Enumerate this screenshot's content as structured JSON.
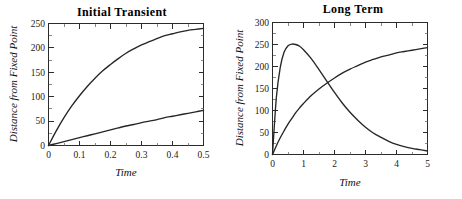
{
  "figure": {
    "background": "#ffffff",
    "curve_color": "#262626",
    "axis_color": "#2b2b2b"
  },
  "panels": {
    "left": {
      "title": "Initial  Transient",
      "xlabel": "Time",
      "ylabel": "Distance from Fixed Point",
      "xticks": [
        "0",
        "0.1",
        "0.2",
        "0.3",
        "0.4",
        "0.5"
      ],
      "yticks": [
        "0",
        "50",
        "100",
        "150",
        "200",
        "250"
      ]
    },
    "right": {
      "title": "Long Term",
      "xlabel": "Time",
      "ylabel": "Distance from Fixed Point",
      "xticks": [
        "0",
        "1",
        "2",
        "3",
        "4",
        "5"
      ],
      "yticks": [
        "0",
        "50",
        "100",
        "150",
        "200",
        "250",
        "300"
      ]
    }
  },
  "chart_data": [
    {
      "type": "line",
      "panel": "left",
      "title": "Initial  Transient",
      "xlabel": "Time",
      "ylabel": "Distance from Fixed Point",
      "xlim": [
        0,
        0.5
      ],
      "ylim": [
        0,
        250
      ],
      "xticks": [
        0,
        0.1,
        0.2,
        0.3,
        0.4,
        0.5
      ],
      "yticks": [
        0,
        50,
        100,
        150,
        200,
        250
      ],
      "grid": false,
      "legend": "none",
      "x": [
        0,
        0.025,
        0.05,
        0.075,
        0.1,
        0.125,
        0.15,
        0.175,
        0.2,
        0.225,
        0.25,
        0.275,
        0.3,
        0.325,
        0.35,
        0.375,
        0.4,
        0.425,
        0.45,
        0.475,
        0.5
      ],
      "series": [
        {
          "name": "fast-rising-curve",
          "values": [
            0,
            30,
            57,
            81,
            102,
            121,
            138,
            153,
            166,
            178,
            189,
            198,
            206,
            213,
            219,
            225,
            229,
            233,
            236,
            238,
            240
          ]
        },
        {
          "name": "slow-rising-curve",
          "values": [
            0,
            4,
            8,
            12,
            16,
            20,
            24,
            28,
            32,
            36,
            40,
            43,
            47,
            50,
            53,
            57,
            60,
            63,
            66,
            69,
            72
          ]
        }
      ]
    },
    {
      "type": "line",
      "panel": "right",
      "title": "Long Term",
      "xlabel": "Time",
      "ylabel": "Distance from Fixed Point",
      "xlim": [
        0,
        5
      ],
      "ylim": [
        0,
        300
      ],
      "xticks": [
        0,
        1,
        2,
        3,
        4,
        5
      ],
      "yticks": [
        0,
        50,
        100,
        150,
        200,
        250,
        300
      ],
      "grid": false,
      "legend": "none",
      "x": [
        0,
        0.125,
        0.25,
        0.375,
        0.5,
        0.625,
        0.75,
        0.875,
        1,
        1.25,
        1.5,
        1.75,
        2,
        2.25,
        2.5,
        2.75,
        3,
        3.25,
        3.5,
        3.75,
        4,
        4.25,
        4.5,
        4.75,
        5
      ],
      "series": [
        {
          "name": "peak-decay-curve",
          "values": [
            0,
            130,
            198,
            233,
            247,
            251,
            250,
            246,
            238,
            218,
            193,
            167,
            141,
            117,
            96,
            78,
            62,
            49,
            39,
            30,
            23,
            18,
            14,
            11,
            8
          ]
        },
        {
          "name": "saturating-curve",
          "values": [
            0,
            20,
            38,
            54,
            69,
            82,
            95,
            106,
            116,
            134,
            149,
            162,
            174,
            185,
            194,
            202,
            210,
            216,
            222,
            226,
            231,
            234,
            237,
            240,
            243
          ]
        }
      ]
    }
  ]
}
